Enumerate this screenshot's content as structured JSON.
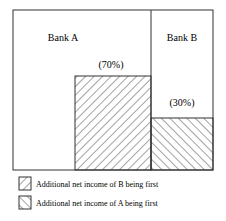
{
  "diagram": {
    "regions": [
      {
        "name": "Bank A",
        "share_label": "(70%)"
      },
      {
        "name": "Bank B",
        "share_label": "(30%)"
      }
    ],
    "legend": [
      {
        "pattern": "forward-hatch",
        "label": "Additional net income of B being first"
      },
      {
        "pattern": "back-hatch",
        "label": "Additional net income of A being first"
      }
    ],
    "colors": {
      "line": "#333333",
      "background": "#ffffff"
    }
  }
}
